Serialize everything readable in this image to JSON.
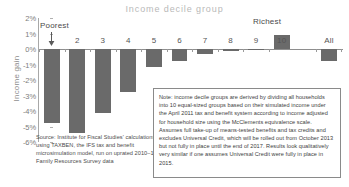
{
  "chart_data": {
    "type": "bar",
    "title": "Income decile group",
    "xlabel": "",
    "ylabel": "Income gain",
    "categories": [
      "1",
      "2",
      "3",
      "4",
      "5",
      "6",
      "7",
      "8",
      "9",
      "10",
      "All"
    ],
    "values": [
      -4.8,
      -5.4,
      -4.1,
      -2.8,
      -1.15,
      -0.75,
      -0.35,
      -0.1,
      -0.02,
      0.9,
      -0.75
    ],
    "ylim": [
      -6,
      2
    ],
    "ytick_labels": [
      "2%",
      "1%",
      "0%",
      "-1%",
      "-2%",
      "-3%",
      "-4%",
      "-5%",
      "-6%"
    ],
    "ytick_values": [
      2,
      1,
      0,
      -1,
      -2,
      -3,
      -4,
      -5,
      -6
    ],
    "grid": false,
    "legend": "none",
    "bar_color": "#6a6a6a",
    "annotations": [
      {
        "text": "Poorest",
        "target_category": "1"
      },
      {
        "text": "Richest",
        "target_category": "10"
      }
    ]
  },
  "annotations": {
    "poorest_label": "Poorest",
    "richest_label": "Richest"
  },
  "source": {
    "text": "Source: Institute for Fiscal Studies' calculations using TAXBEN, the IFS tax and benefit microsimulation model, run on uprated 2010–11 Family Resources Survey data"
  },
  "note": {
    "text": "Note: income decile groups are derived by dividing all households into 10 equal-sized groups based on their simulated income under the April 2011 tax and benefit system according to income adjusted for household size using the McClements equivalence scale. Assumes full take-up of means-tested benefits and tax credits and excludes Universal Credit, which will be rolled out from October 2013 but not fully in place until the end of 2017. Results look qualitatively very similar if one assumes Universal Credit were fully in place in 2015."
  },
  "colors": {
    "bar": "#6a6a6a",
    "title": "#b9b9b9",
    "axis": "#8e8e8e",
    "text": "#3d3d3d"
  }
}
